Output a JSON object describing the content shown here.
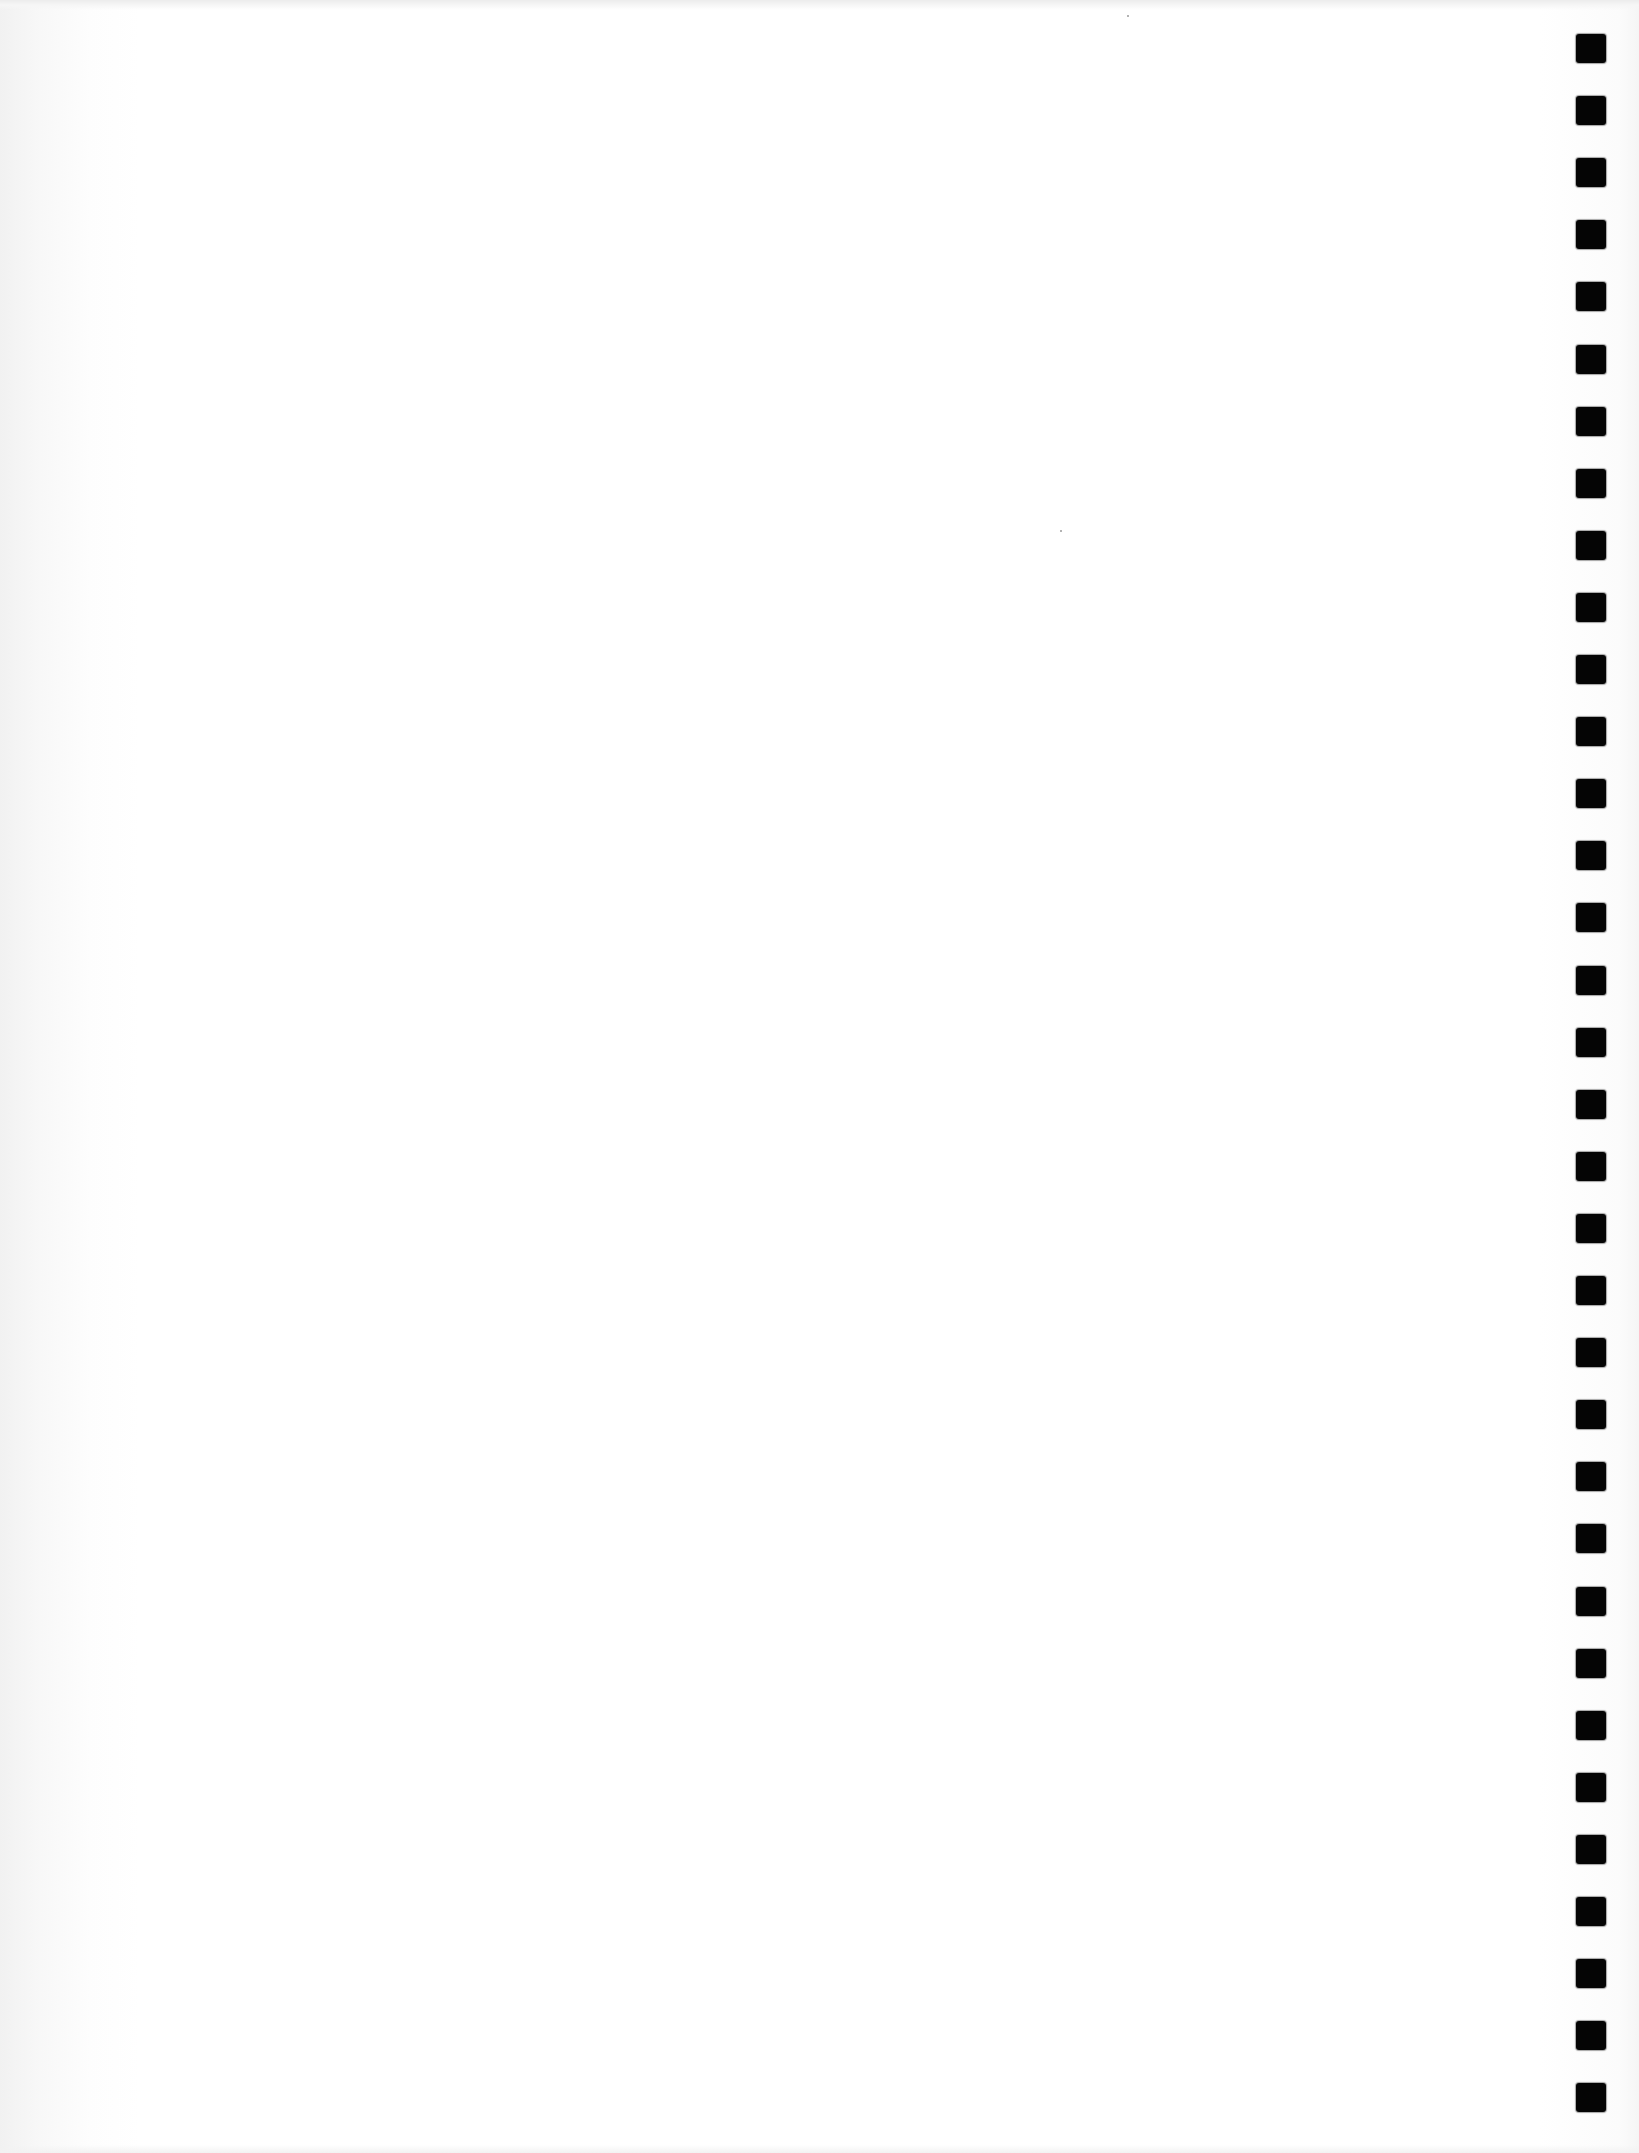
{
  "page": {
    "type": "blank notebook page (scanned)",
    "background_color": "#ffffff",
    "edge_shadow_color": "#f1f1f1"
  },
  "binding": {
    "side": "right",
    "hole_color": "#050505",
    "hole_size_px": [
      30,
      29
    ],
    "first_hole_top_px": 34,
    "pitch_px": 62.1,
    "hole_count": 34
  },
  "specks": [
    {
      "x": 1127,
      "y": 15
    },
    {
      "x": 1060,
      "y": 530
    }
  ]
}
